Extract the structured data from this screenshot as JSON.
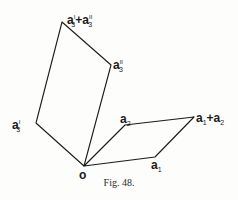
{
  "figure": {
    "caption": "Fig. 48.",
    "line_color": "#1a1a1a",
    "vertices": {
      "o": [
        84,
        166
      ],
      "a1": [
        155,
        157
      ],
      "a2": [
        125,
        125
      ],
      "a1_plus_a2": [
        194,
        117
      ],
      "a3_prime": [
        36,
        123
      ],
      "a3_double_prime": [
        111,
        65
      ],
      "a3_prime_plus_a3_double_prime": [
        62,
        22
      ]
    },
    "labels": {
      "o": "o",
      "a1": {
        "base": "a",
        "sub": "1"
      },
      "a2": {
        "base": "a",
        "sub": "2"
      },
      "a1_plus_a2": {
        "base1": "a",
        "sub1": "1",
        "plus": "+",
        "base2": "a",
        "sub2": "2"
      },
      "a3_prime": {
        "base": "a",
        "sup": "I",
        "sub": "3"
      },
      "a3_double_prime": {
        "base": "a",
        "sup": "II",
        "sub": "3"
      },
      "a3_sum": {
        "base1": "a",
        "sup1": "I",
        "sub1": "3",
        "plus": "+",
        "base2": "a",
        "sup2": "II",
        "sub2": "3"
      }
    }
  }
}
